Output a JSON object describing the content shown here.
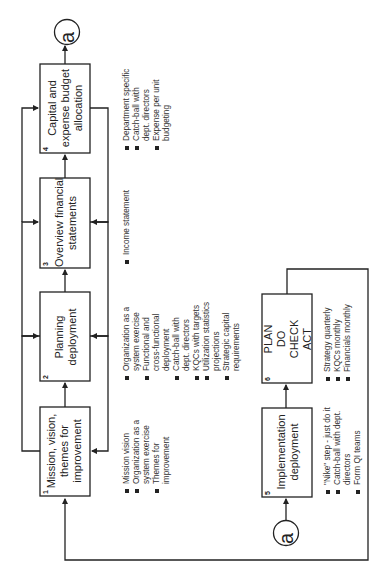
{
  "connector_label": "a",
  "boxes": [
    {
      "number": "1",
      "title_lines": [
        "Mission, vision,",
        "themes for",
        "improvement"
      ]
    },
    {
      "number": "2",
      "title_lines": [
        "Planning",
        "deployment"
      ]
    },
    {
      "number": "3",
      "title_lines": [
        "Overview financial",
        "statements"
      ]
    },
    {
      "number": "4",
      "title_lines": [
        "Capital and",
        "expense budget",
        "allocation"
      ]
    },
    {
      "number": "5",
      "title_lines": [
        "Implementation",
        "deployment"
      ]
    },
    {
      "number": "6",
      "title_lines": [
        "PLAN",
        "DO",
        "CHECK",
        "ACT"
      ]
    }
  ],
  "bullets": {
    "box1": [
      {
        "lines": [
          "Mission vision"
        ]
      },
      {
        "lines": [
          "Organization as a",
          "system exercise"
        ]
      },
      {
        "lines": [
          "Themes for",
          "improvement"
        ]
      }
    ],
    "box2": [
      {
        "lines": [
          "Organization as a",
          "system exercise"
        ]
      },
      {
        "lines": [
          "Functional and",
          "cross-functional",
          "deployment"
        ]
      },
      {
        "lines": [
          "Catch-ball with",
          "dept. directors"
        ]
      },
      {
        "lines": [
          "KQCs with targets"
        ]
      },
      {
        "lines": [
          "Utilization statistics",
          "projections"
        ]
      },
      {
        "lines": [
          "Strategic capital",
          "requirements"
        ]
      }
    ],
    "box3": [
      {
        "lines": [
          "Income statement"
        ]
      }
    ],
    "box4": [
      {
        "lines": [
          "Department specific"
        ]
      },
      {
        "lines": [
          "Catch-ball with",
          "dept. directors"
        ]
      },
      {
        "lines": [
          "Expense per unit",
          "budgeting"
        ]
      }
    ],
    "box5": [
      {
        "lines": [
          "\"Nike\" step - just do it"
        ]
      },
      {
        "lines": [
          "Catch-ball with dept.",
          "directors"
        ]
      },
      {
        "lines": [
          "Form QI teams"
        ]
      }
    ],
    "box6": [
      {
        "lines": [
          "Strategy quarterly"
        ]
      },
      {
        "lines": [
          "KQCs monthly"
        ]
      },
      {
        "lines": [
          "Financials monthly"
        ]
      }
    ]
  }
}
